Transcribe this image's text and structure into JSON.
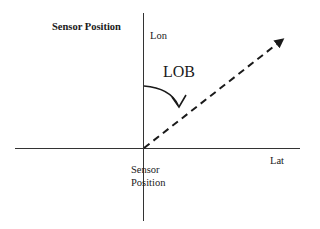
{
  "diagram": {
    "title": "Sensor Position",
    "axes": {
      "vertical_label": "Lon",
      "horizontal_label": "Lat"
    },
    "angle_label": "LOB",
    "origin_label_line1": "Sensor",
    "origin_label_line2": "Position",
    "line_style": "dashed",
    "stroke_color": "#1a1a1a"
  }
}
